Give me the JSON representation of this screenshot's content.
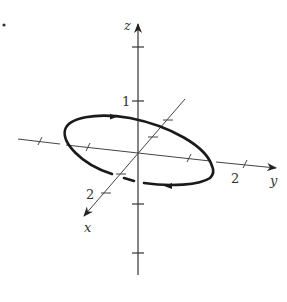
{
  "figure": {
    "type": "3d-axes-ellipse",
    "axes": {
      "x": {
        "label": "x",
        "tick_labels": {
          "2": "2"
        }
      },
      "y": {
        "label": "y",
        "tick_labels": {
          "2": "2"
        }
      },
      "z": {
        "label": "z",
        "tick_labels": {
          "1": "1"
        }
      }
    },
    "curve": {
      "shape": "ellipse",
      "orientation": "counterclockwise-arrows",
      "arrow_count": 2
    },
    "colors": {
      "ink": "#222222",
      "background": "#ffffff"
    }
  }
}
